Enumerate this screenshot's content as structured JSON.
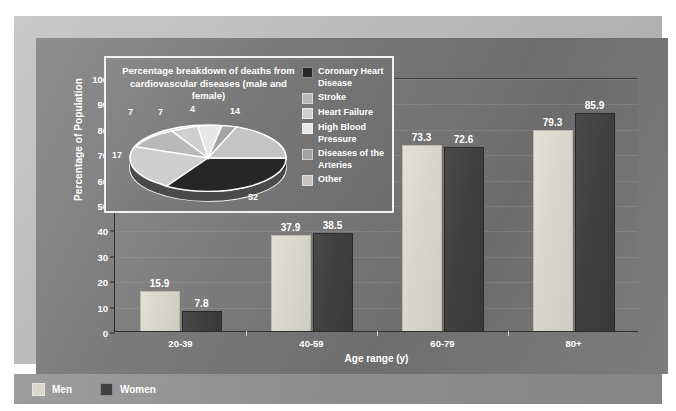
{
  "chart_data": {
    "type": "bar",
    "title": "",
    "xlabel": "Age range (y)",
    "ylabel": "Percentage of Population",
    "categories": [
      "20-39",
      "40-59",
      "60-79",
      "80+"
    ],
    "series": [
      {
        "name": "Men",
        "color": "#dad7cc",
        "values": [
          15.9,
          37.9,
          73.3,
          79.3
        ]
      },
      {
        "name": "Women",
        "color": "#404040",
        "values": [
          7.8,
          38.5,
          72.6,
          85.9
        ]
      }
    ],
    "ylim": [
      0,
      100
    ],
    "yticks": [
      0,
      10,
      20,
      30,
      40,
      50,
      60,
      70,
      80,
      90,
      100
    ],
    "grid": true,
    "legend_position": "bottom",
    "inset": {
      "type": "pie",
      "title": "Percentage breakdown of deaths from cardiovascular diseases (male and female)",
      "labels": [
        "Coronary Heart Disease",
        "Stroke",
        "Heart Failure",
        "High Blood Pressure",
        "Diseases of the Arteries",
        "Other"
      ],
      "values": [
        52,
        17,
        7,
        7,
        4,
        14
      ],
      "colors": [
        "#262626",
        "#b9b9b9",
        "#cfcfcf",
        "#e8e8e8",
        "#a3a3a3",
        "#c4c4c4"
      ],
      "legend_position": "right"
    }
  },
  "axes": {
    "y_title": "Percentage of Population",
    "x_title": "Age range (y)",
    "y_ticks": [
      "100",
      "90",
      "80",
      "70",
      "60",
      "50",
      "40",
      "30",
      "20",
      "10",
      "0"
    ],
    "x_ticks": [
      "20-39",
      "40-59",
      "60-79",
      "80+"
    ]
  },
  "bars": [
    {
      "group": "20-39",
      "series": "Men",
      "value": 15.9,
      "label": "15.9"
    },
    {
      "group": "20-39",
      "series": "Women",
      "value": 7.8,
      "label": "7.8"
    },
    {
      "group": "40-59",
      "series": "Men",
      "value": 37.9,
      "label": "37.9"
    },
    {
      "group": "40-59",
      "series": "Women",
      "value": 38.5,
      "label": "38.5"
    },
    {
      "group": "60-79",
      "series": "Men",
      "value": 73.3,
      "label": "73.3"
    },
    {
      "group": "60-79",
      "series": "Women",
      "value": 72.6,
      "label": "72.6"
    },
    {
      "group": "80+",
      "series": "Men",
      "value": 79.3,
      "label": "79.3"
    },
    {
      "group": "80+",
      "series": "Women",
      "value": 85.9,
      "label": "85.9"
    }
  ],
  "inset": {
    "title": "Percentage breakdown of deaths from cardiovascular diseases (male and female)",
    "pie_numbers": [
      "52",
      "17",
      "7",
      "7",
      "4",
      "14"
    ],
    "legend": [
      {
        "label": "Coronary Heart Disease",
        "color": "#262626"
      },
      {
        "label": "Stroke",
        "color": "#b9b9b9"
      },
      {
        "label": "Heart Failure",
        "color": "#cfcfcf"
      },
      {
        "label": "High Blood Pressure",
        "color": "#e8e8e8"
      },
      {
        "label": "Diseases of the Arteries",
        "color": "#a3a3a3"
      },
      {
        "label": "Other",
        "color": "#c4c4c4"
      }
    ]
  },
  "legend": {
    "items": [
      {
        "label": "Men",
        "color": "#dad7cc"
      },
      {
        "label": "Women",
        "color": "#404040"
      }
    ]
  },
  "colors": {
    "men": "#dad7cc",
    "women": "#404040",
    "panel": "#7b7b7b",
    "frame": "#bcbcbc",
    "text": "#ffffff"
  }
}
